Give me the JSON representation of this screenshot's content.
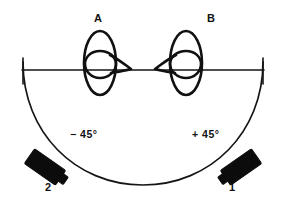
{
  "figure": {
    "type": "acoustic-beam-schematic",
    "background_color": "#ffffff",
    "line_color": "#151515",
    "probe_color": "#0c0c0c"
  },
  "site_labels": {
    "left": "A",
    "right": "B"
  },
  "angle_labels": {
    "left": "− 45°",
    "right": "+ 45°"
  },
  "probe_labels": {
    "left": "2",
    "right": "1"
  },
  "geometry": {
    "baseline_y": 70,
    "baseline_x_start": 22,
    "baseline_x_end": 264,
    "arc_center_x": 143,
    "arc_bottom_y": 185,
    "site_a_x": 100,
    "site_b_x": 186,
    "lobe_top_y": 31,
    "lobe_bottom_y": 95
  }
}
